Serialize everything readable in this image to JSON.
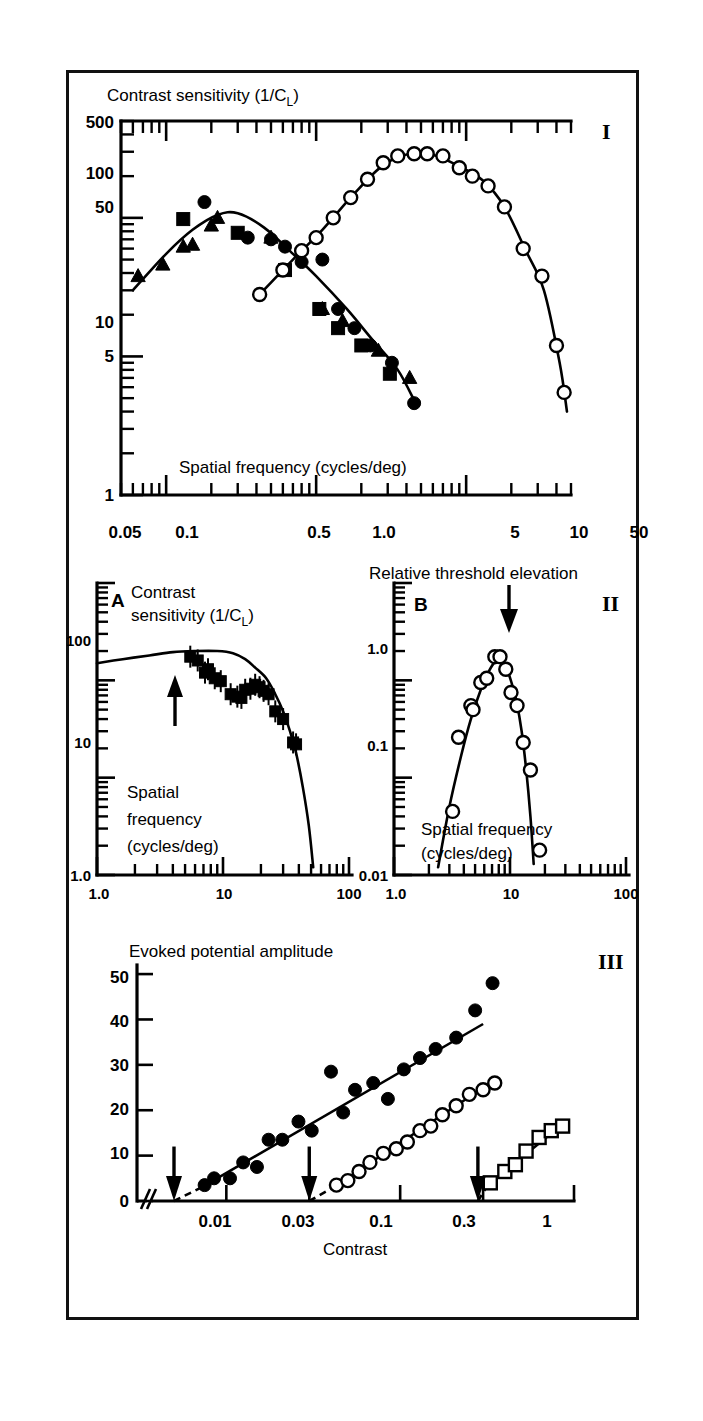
{
  "figure": {
    "panels": [
      {
        "id": "I",
        "roman": "I",
        "ytitle": "Contrast sensitivity (1/C",
        "ytitle_sub": "L",
        "ytitle_tail": ")",
        "xtitle": "Spatial frequency (cycles/deg)",
        "yticks": [
          "500",
          "100",
          "50",
          "10",
          "5",
          "1"
        ],
        "xticks": [
          "0.05",
          "0.1",
          "0.5",
          "1.0",
          "5",
          "10",
          "50"
        ]
      },
      {
        "id": "II",
        "roman": "II",
        "subpanels": [
          {
            "letter": "A",
            "ytitle_line1": "Contrast",
            "ytitle_line2": "sensitivity (1/C",
            "ytitle_sub": "L",
            "ytitle_tail": ")",
            "xtitle_line1": "Spatial",
            "xtitle_line2": "frequency",
            "xtitle_line3": "(cycles/deg)",
            "yticks": [
              "100",
              "10",
              "1.0"
            ],
            "xticks": [
              "1.0",
              "10",
              "100"
            ]
          },
          {
            "letter": "B",
            "ytitle": "Relative threshold elevation",
            "xtitle_line1": "Spatial frequency",
            "xtitle_line2": "(cycles/deg)",
            "yticks": [
              "1.0",
              "0.1",
              "0.01"
            ],
            "xticks": [
              "1.0",
              "10",
              "100"
            ]
          }
        ]
      },
      {
        "id": "III",
        "roman": "III",
        "ytitle": "Evoked potential amplitude",
        "xtitle": "Contrast",
        "yticks": [
          "50",
          "40",
          "30",
          "20",
          "10",
          "0"
        ],
        "xticks": [
          "0.01",
          "0.03",
          "0.1",
          "0.3",
          "1"
        ]
      }
    ]
  },
  "chart_data": [
    {
      "type": "scatter",
      "panel": "I",
      "title": "",
      "xlabel": "Spatial frequency (cycles/deg)",
      "ylabel": "Contrast sensitivity (1/CL)",
      "xscale": "log",
      "yscale": "log",
      "xlim": [
        0.05,
        50
      ],
      "ylim": [
        1,
        500
      ],
      "grid": false,
      "legend": "none",
      "series": [
        {
          "name": "low-frequency-branch-filled-circles",
          "marker": "filled-circle",
          "x": [
            0.18,
            0.35,
            0.5,
            0.62,
            0.8,
            1.1,
            1.4,
            1.8,
            2.3,
            3.2,
            4.5
          ],
          "y": [
            130,
            72,
            70,
            62,
            48,
            50,
            22,
            16,
            12,
            9,
            4.6
          ]
        },
        {
          "name": "low-frequency-branch-filled-triangles",
          "marker": "filled-triangle",
          "x": [
            0.065,
            0.095,
            0.13,
            0.15,
            0.2,
            0.22,
            0.5,
            1.1,
            1.5,
            2.6,
            4.2
          ],
          "y": [
            38,
            46,
            62,
            64,
            88,
            100,
            72,
            22,
            18,
            11,
            7
          ]
        },
        {
          "name": "low-frequency-branch-filled-squares",
          "marker": "filled-square",
          "x": [
            0.13,
            0.3,
            0.62,
            1.05,
            1.4,
            2.0,
            3.1
          ],
          "y": [
            98,
            78,
            42,
            22,
            16,
            12,
            7.5
          ]
        },
        {
          "name": "high-frequency-branch-open-circles",
          "marker": "open-circle",
          "x": [
            0.42,
            0.6,
            0.8,
            1.0,
            1.3,
            1.7,
            2.2,
            2.8,
            3.5,
            4.5,
            5.5,
            7.0,
            9.0,
            11,
            14,
            18,
            24,
            32,
            40,
            45
          ],
          "y": [
            28,
            42,
            58,
            72,
            100,
            140,
            190,
            250,
            280,
            290,
            290,
            280,
            230,
            200,
            170,
            120,
            60,
            38,
            12,
            5.5
          ]
        }
      ]
    },
    {
      "type": "scatter",
      "panel": "II-A",
      "title": "A",
      "xlabel": "Spatial frequency (cycles/deg)",
      "ylabel": "Contrast sensitivity (1/CL)",
      "xscale": "log",
      "yscale": "log",
      "xlim": [
        1.0,
        100
      ],
      "ylim": [
        1.0,
        1000
      ],
      "grid": false,
      "annotation": "upward arrow at adapting spatial frequency ~16 c/deg",
      "series": [
        {
          "name": "contrast-sensitivity-filled-squares",
          "marker": "filled-square-errorbar",
          "x": [
            5.5,
            6.3,
            7.2,
            7.6,
            8.6,
            9.6,
            11.5,
            13,
            14,
            15,
            16.5,
            18,
            19.5,
            21,
            23,
            26,
            30,
            36,
            38
          ],
          "y": [
            175,
            160,
            120,
            130,
            105,
            98,
            72,
            68,
            66,
            80,
            82,
            90,
            85,
            78,
            72,
            48,
            40,
            23,
            22
          ]
        }
      ]
    },
    {
      "type": "scatter",
      "panel": "II-B",
      "title": "B",
      "xlabel": "Spatial frequency (cycles/deg)",
      "ylabel": "Relative threshold elevation",
      "xscale": "log",
      "yscale": "log",
      "xlim": [
        1.0,
        100
      ],
      "ylim": [
        0.01,
        10
      ],
      "grid": false,
      "annotation": "downward arrow at adapting spatial frequency ~8 c/deg",
      "series": [
        {
          "name": "threshold-elevation-open-circles",
          "marker": "open-circle",
          "x": [
            3.2,
            3.6,
            4.6,
            4.8,
            5.6,
            6.3,
            7.4,
            8.2,
            9.2,
            10.2,
            11.5,
            13,
            15,
            18
          ],
          "y": [
            0.045,
            0.26,
            0.55,
            0.5,
            0.95,
            1.05,
            1.75,
            1.75,
            1.3,
            0.75,
            0.55,
            0.23,
            0.12,
            0.018
          ]
        }
      ]
    },
    {
      "type": "scatter",
      "panel": "III",
      "title": "",
      "xlabel": "Contrast",
      "ylabel": "Evoked potential amplitude",
      "xscale": "log",
      "yscale": "linear",
      "xlim": [
        0.005,
        1
      ],
      "ylim": [
        0,
        52
      ],
      "grid": false,
      "annotation": "three downward arrows mark extrapolated thresholds at contrast 0.005, 0.03 and 0.28",
      "thresholds": [
        0.005,
        0.03,
        0.28
      ],
      "series": [
        {
          "name": "series-1-filled-circles",
          "marker": "filled-circle",
          "x": [
            0.0075,
            0.0085,
            0.0105,
            0.0125,
            0.015,
            0.0175,
            0.021,
            0.026,
            0.031,
            0.04,
            0.047,
            0.055,
            0.07,
            0.085,
            0.105,
            0.13,
            0.16,
            0.21,
            0.27,
            0.34
          ],
          "y": [
            3.5,
            5.0,
            5.0,
            8.5,
            7.5,
            13.5,
            13.5,
            17.5,
            15.5,
            28.5,
            19.5,
            24.5,
            26.0,
            22.5,
            29.0,
            31.5,
            33.5,
            36.0,
            42.0,
            48.0
          ]
        },
        {
          "name": "series-2-open-circles",
          "marker": "open-circle",
          "x": [
            0.043,
            0.05,
            0.058,
            0.067,
            0.08,
            0.095,
            0.11,
            0.13,
            0.15,
            0.175,
            0.21,
            0.25,
            0.3,
            0.35
          ],
          "y": [
            3.5,
            4.5,
            6.5,
            8.5,
            10.5,
            11.5,
            13.0,
            15.5,
            16.5,
            19.0,
            21.0,
            23.5,
            24.5,
            26.0
          ]
        },
        {
          "name": "series-3-open-squares",
          "marker": "open-square",
          "x": [
            0.33,
            0.4,
            0.46,
            0.53,
            0.63,
            0.74,
            0.86
          ],
          "y": [
            4.0,
            6.5,
            8.0,
            11.0,
            14.0,
            15.5,
            16.5
          ]
        }
      ]
    }
  ]
}
